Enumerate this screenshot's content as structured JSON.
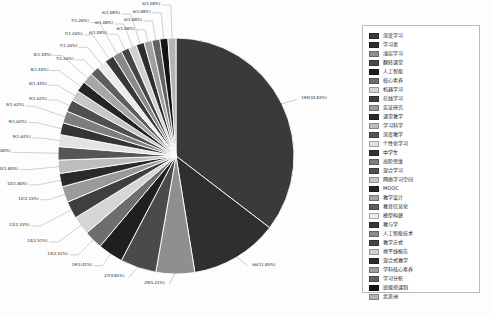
{
  "chart_data": {
    "type": "pie",
    "title": "",
    "total": 557,
    "legend_position": "right",
    "categories": [
      "深度学习",
      "学习者",
      "浅层学习",
      "翻转课堂",
      "人工智能",
      "核心素养",
      "机器学习",
      "在线学习",
      "实证研究",
      "课堂教学",
      "学习科学",
      "深度教学",
      "个性化学习",
      "中学生",
      "高阶思维",
      "混合学习",
      "网络学习空间",
      "MOOC",
      "教学设计",
      "教育信息化",
      "模型构建",
      "教与学",
      "人工智能技术",
      "教学方式",
      "地平线报告",
      "混合式教学",
      "学科核心素养",
      "学习分析",
      "班级授课制",
      "北美洲"
    ],
    "values": [
      194,
      66,
      29,
      27,
      19,
      14,
      14,
      13,
      12,
      10,
      10,
      10,
      9,
      9,
      9,
      9,
      8,
      8,
      8,
      7,
      7,
      7,
      7,
      6,
      6,
      6,
      6,
      6,
      6,
      6
    ],
    "percents": [
      "34.83%",
      "11.85%",
      "5.21%",
      "4.85%",
      "3.41%",
      "2.51%",
      "2.51%",
      "2.33%",
      "2.15%",
      "1.80%",
      "1.80%",
      "1.80%",
      "1.62%",
      "1.62%",
      "1.62%",
      "1.62%",
      "1.44%",
      "1.44%",
      "1.44%",
      "1.26%",
      "1.26%",
      "1.26%",
      "1.26%",
      "1.08%",
      "1.08%",
      "1.08%",
      "1.08%",
      "1.08%",
      "1.08%",
      "1.08%"
    ],
    "labels": [
      "194(34.83%)",
      "66(11.85%)",
      "29(5.21%)",
      "27(4.85%)",
      "19(3.41%)",
      "14(2.51%)",
      "14(2.51%)",
      "13(2.33%)",
      "12(2.15%)",
      "10(1.80%)",
      "10(1.80%)",
      "10(1.80%)",
      "9(1.62%)",
      "9(1.62%)",
      "9(1.62%)",
      "9(1.62%)",
      "8(1.44%)",
      "8(1.44%)",
      "8(1.44%)",
      "7(1.26%)",
      "7(1.26%)",
      "7(1.26%)",
      "7(1.26%)",
      "6(1.08%)",
      "6(1.08%)",
      "6(1.08%)",
      "6(1.08%)",
      "6(1.08%)",
      "6(1.08%)",
      "6(1.08%)"
    ],
    "colors": [
      "#3a3a3a",
      "#2f2f2f",
      "#8f8f8f",
      "#4a4a4a",
      "#1f1f1f",
      "#6e6e6e",
      "#d6d6d6",
      "#3f3f3f",
      "#9a9a9a",
      "#2a2a2a",
      "#bdbdbd",
      "#565656",
      "#e3e3e3",
      "#343434",
      "#7e7e7e",
      "#4f4f4f",
      "#c7c7c7",
      "#252525",
      "#a6a6a6",
      "#5e5e5e",
      "#ececec",
      "#383838",
      "#8a8a8a",
      "#454545",
      "#d0d0d0",
      "#2d2d2d",
      "#9f9f9f",
      "#636363",
      "#141414",
      "#b4b4b4"
    ],
    "xlabel": "",
    "ylabel": "",
    "grid": false
  }
}
